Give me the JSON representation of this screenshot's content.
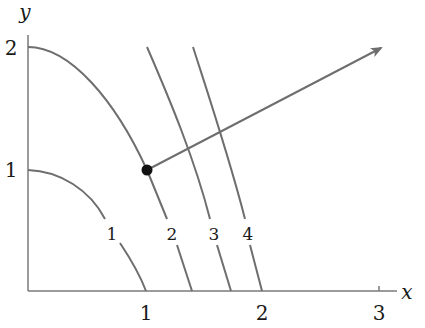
{
  "figure": {
    "type": "level-curves-with-gradient",
    "axes": {
      "x_label": "x",
      "y_label": "y",
      "x_ticks": [
        "1",
        "2",
        "3"
      ],
      "y_ticks": [
        "1",
        "2"
      ],
      "x_range": [
        0,
        3
      ],
      "y_range": [
        0,
        2
      ]
    },
    "level_curves": [
      {
        "label": "1",
        "from": [
          0,
          1
        ],
        "to": [
          1,
          0
        ]
      },
      {
        "label": "2",
        "from": [
          0,
          2
        ],
        "to": [
          1.4,
          0
        ]
      },
      {
        "label": "3",
        "from": [
          1,
          2
        ],
        "to": [
          1.72,
          0
        ]
      },
      {
        "label": "4",
        "from": [
          1.4,
          2
        ],
        "to": [
          2,
          0
        ]
      }
    ],
    "point": {
      "x": 1,
      "y": 1,
      "name": "base point on level curve 2"
    },
    "gradient_arrow": {
      "from": [
        1,
        1
      ],
      "to": [
        3.0,
        2.05
      ]
    },
    "colors": {
      "curve": "#6e6e6e",
      "axis": "#7a7a7a",
      "point": "#111111",
      "text": "#1a1a1a"
    }
  }
}
